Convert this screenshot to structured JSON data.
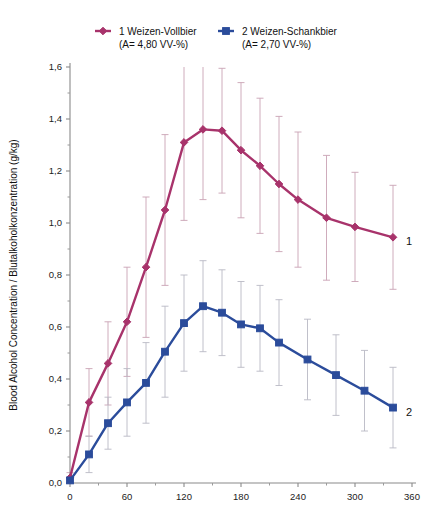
{
  "chart_data": {
    "type": "line",
    "title": "",
    "xlabel": "",
    "ylabel": "Blood Alcohol Concentration / Blutalkoholkonzentration (g/kg)",
    "xlim": [
      0,
      360
    ],
    "ylim": [
      0.0,
      1.6
    ],
    "x_ticks": [
      0,
      60,
      120,
      180,
      240,
      300,
      360
    ],
    "x_tick_labels": [
      "0",
      "60",
      "120",
      "180",
      "240",
      "300",
      "360"
    ],
    "x_minor_step": 30,
    "y_ticks": [
      0.0,
      0.2,
      0.4,
      0.6,
      0.8,
      1.0,
      1.2,
      1.4,
      1.6
    ],
    "y_tick_labels": [
      "0,0",
      "0,2",
      "0,4",
      "0,6",
      "0,8",
      "1,0",
      "1,2",
      "1,4",
      "1,6"
    ],
    "y_minor_step": 0.1,
    "grid": false,
    "legend_position": "top",
    "error_bars": true,
    "series": [
      {
        "name": "1 Weizen-Vollbier",
        "sublabel": "(A= 4,80 VV-%)",
        "legend_label": "1 Weizen-Vollbier",
        "end_label": "1",
        "color": "#A8336B",
        "marker": "diamond",
        "x": [
          0,
          20,
          40,
          60,
          80,
          100,
          120,
          140,
          160,
          180,
          200,
          220,
          240,
          270,
          300,
          340
        ],
        "values": [
          0.02,
          0.31,
          0.46,
          0.62,
          0.83,
          1.05,
          1.31,
          1.36,
          1.355,
          1.28,
          1.22,
          1.15,
          1.09,
          1.02,
          0.985,
          0.945
        ],
        "err_lower": [
          0.02,
          0.13,
          0.16,
          0.21,
          0.27,
          0.29,
          0.3,
          0.27,
          0.24,
          0.26,
          0.26,
          0.26,
          0.26,
          0.24,
          0.21,
          0.2
        ],
        "err_upper": [
          0.02,
          0.13,
          0.16,
          0.21,
          0.27,
          0.29,
          0.3,
          0.27,
          0.24,
          0.26,
          0.26,
          0.26,
          0.26,
          0.24,
          0.21,
          0.2
        ]
      },
      {
        "name": "2 Weizen-Schankbier",
        "sublabel": "(A= 2,70 VV-%)",
        "legend_label": "2 Weizen-Schankbier",
        "end_label": "2",
        "color": "#2B4C9B",
        "marker": "square",
        "x": [
          0,
          20,
          40,
          60,
          80,
          100,
          120,
          140,
          160,
          180,
          200,
          220,
          250,
          280,
          310,
          340
        ],
        "values": [
          0.01,
          0.11,
          0.23,
          0.31,
          0.385,
          0.505,
          0.615,
          0.68,
          0.655,
          0.61,
          0.595,
          0.54,
          0.475,
          0.415,
          0.355,
          0.29
        ],
        "err_lower": [
          0.01,
          0.07,
          0.1,
          0.13,
          0.155,
          0.175,
          0.185,
          0.175,
          0.165,
          0.165,
          0.165,
          0.165,
          0.155,
          0.155,
          0.155,
          0.155
        ],
        "err_upper": [
          0.01,
          0.07,
          0.1,
          0.13,
          0.155,
          0.175,
          0.185,
          0.175,
          0.165,
          0.165,
          0.165,
          0.165,
          0.155,
          0.155,
          0.155,
          0.155
        ]
      }
    ]
  },
  "legend": {
    "entries": [
      {
        "label": "1 Weizen-Vollbier",
        "sublabel": "(A= 4,80 VV-%)",
        "color": "#A8336B",
        "marker": "diamond"
      },
      {
        "label": "2 Weizen-Schankbier",
        "sublabel": "(A= 2,70 VV-%)",
        "color": "#2B4C9B",
        "marker": "square"
      }
    ]
  }
}
